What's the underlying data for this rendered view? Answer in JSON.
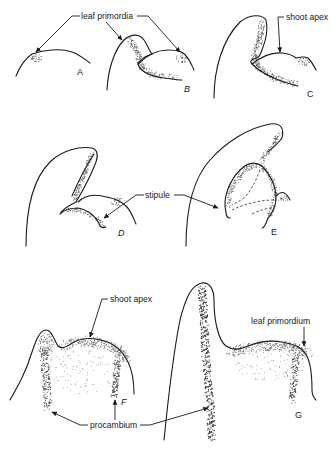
{
  "figure": {
    "panels": [
      {
        "id": "A",
        "letter": "A"
      },
      {
        "id": "B",
        "letter": "B"
      },
      {
        "id": "C",
        "letter": "C"
      },
      {
        "id": "D",
        "letter": "D"
      },
      {
        "id": "E",
        "letter": "E"
      },
      {
        "id": "F",
        "letter": "F"
      },
      {
        "id": "G",
        "letter": "G"
      }
    ],
    "labels": {
      "leaf_primordia": "leaf primordia",
      "shoot_apex_top": "shoot apex",
      "stipule": "stipule",
      "shoot_apex_bottom": "shoot apex",
      "leaf_primordium": "leaf primordium",
      "procambium": "procambium"
    },
    "colors": {
      "ink": "#1a1a1a",
      "background": "#ffffff"
    }
  }
}
